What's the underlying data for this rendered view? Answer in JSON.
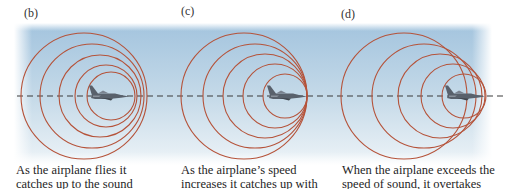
{
  "figure": {
    "colors": {
      "sky": "#a9c8df",
      "wave": "#b5533a",
      "wave_hot": "#c9482a",
      "dash": "#3a3a3a",
      "plane": "#5c6470"
    },
    "panels": [
      {
        "label": "(b)",
        "caption_lines": [
          "As the airplane flies it",
          "catches up to the sound"
        ],
        "circles": [
          {
            "cx": 84,
            "r": 63
          },
          {
            "cx": 92,
            "r": 52
          },
          {
            "cx": 100,
            "r": 41
          },
          {
            "cx": 106,
            "r": 31
          },
          {
            "cx": 111,
            "r": 24
          }
        ],
        "plane_x": 89
      },
      {
        "label": "(c)",
        "caption_lines": [
          "As the airplane’s speed",
          "increases it catches up with"
        ],
        "circles": [
          {
            "cx": 244,
            "r": 63
          },
          {
            "cx": 255,
            "r": 52
          },
          {
            "cx": 265,
            "r": 42
          },
          {
            "cx": 275,
            "r": 32
          },
          {
            "cx": 285,
            "r": 22
          }
        ],
        "plane_x": 267
      },
      {
        "label": "(d)",
        "caption_lines": [
          "When the airplane exceeds the",
          "speed of sound, it overtakes"
        ],
        "circles": [
          {
            "cx": 404,
            "r": 63
          },
          {
            "cx": 424,
            "r": 52
          },
          {
            "cx": 440,
            "r": 42
          },
          {
            "cx": 453,
            "r": 32
          },
          {
            "cx": 464,
            "r": 22
          }
        ],
        "plane_x": 445
      }
    ]
  }
}
